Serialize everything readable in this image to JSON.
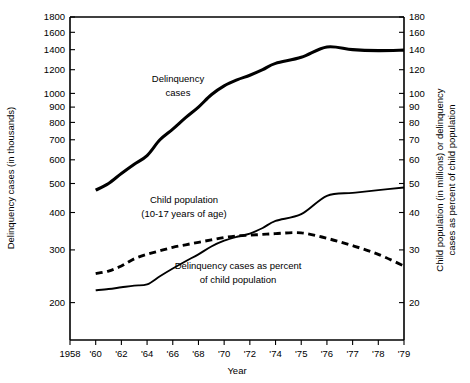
{
  "chart_data": {
    "type": "line",
    "title": "",
    "xlabel": "Year",
    "ylabel": "Delinquency cases (in thousands)",
    "y2label": "Child population (in millions) or delinquency cases as percent of child population",
    "yscale": "log",
    "y2scale": "log",
    "ylim": [
      150,
      1800
    ],
    "y2lim": [
      15,
      180
    ],
    "grid": false,
    "legend_position": "inline-annotations",
    "x_tick_labels": [
      "1958",
      "'60",
      "'62",
      "'64",
      "'66",
      "'68",
      "'70",
      "'72",
      "'74",
      "'75",
      "'76",
      "'77",
      "'78",
      "'79"
    ],
    "x_tick_years": [
      1958,
      1960,
      1962,
      1964,
      1966,
      1968,
      1970,
      1972,
      1974,
      1975,
      1976,
      1977,
      1978,
      1979
    ],
    "y_tick_labels": [
      "1800",
      "1600",
      "1400",
      "1200",
      "1000",
      "900",
      "800",
      "700",
      "600",
      "500",
      "400",
      "300",
      "200"
    ],
    "y_tick_values": [
      1800,
      1600,
      1400,
      1200,
      1000,
      900,
      800,
      700,
      600,
      500,
      400,
      300,
      200
    ],
    "y2_tick_labels": [
      "180",
      "160",
      "140",
      "120",
      "100",
      "90",
      "80",
      "70",
      "60",
      "50",
      "40",
      "30",
      "20"
    ],
    "y2_tick_values": [
      180,
      160,
      140,
      120,
      100,
      90,
      80,
      70,
      60,
      50,
      40,
      30,
      20
    ],
    "series": [
      {
        "name": "Delinquency cases",
        "label": "Delinquency\ncases",
        "label_line1": "Delinquency",
        "label_line2": "cases",
        "style": "solid",
        "axis": "left",
        "units": "thousands",
        "x": [
          1960,
          1961,
          1962,
          1963,
          1964,
          1965,
          1966,
          1967,
          1968,
          1969,
          1970,
          1971,
          1972,
          1973,
          1974,
          1975,
          1976,
          1977,
          1978,
          1979
        ],
        "values": [
          475,
          500,
          540,
          580,
          620,
          700,
          760,
          830,
          900,
          990,
          1060,
          1110,
          1150,
          1200,
          1260,
          1320,
          1430,
          1400,
          1390,
          1395
        ]
      },
      {
        "name": "Child population (10-17 years of age)",
        "label_line1": "Child population",
        "label_line2": "(10-17 years of age)",
        "style": "dashed",
        "axis": "right",
        "units": "millions",
        "x": [
          1960,
          1961,
          1962,
          1963,
          1964,
          1965,
          1966,
          1967,
          1968,
          1969,
          1970,
          1971,
          1972,
          1973,
          1974,
          1975,
          1976,
          1977,
          1978,
          1979
        ],
        "values": [
          25.0,
          25.5,
          26.5,
          28.0,
          29.0,
          29.8,
          30.6,
          31.2,
          31.8,
          32.4,
          33.0,
          33.4,
          33.6,
          33.8,
          34.0,
          34.2,
          32.8,
          31.0,
          29.0,
          26.5
        ]
      },
      {
        "name": "Delinquency cases as percent of child population",
        "label_line1": "Delinquency cases as percent",
        "label_line2": "of child population",
        "style": "solid",
        "axis": "right",
        "units": "percent",
        "x": [
          1960,
          1961,
          1962,
          1963,
          1964,
          1965,
          1966,
          1967,
          1968,
          1969,
          1970,
          1971,
          1972,
          1973,
          1974,
          1975,
          1976,
          1977,
          1978,
          1979
        ],
        "values": [
          22.0,
          22.2,
          22.5,
          22.8,
          23.0,
          24.5,
          26.0,
          27.5,
          29.0,
          30.8,
          32.2,
          33.2,
          34.0,
          35.5,
          37.5,
          39.5,
          45.5,
          46.5,
          47.5,
          48.5
        ]
      }
    ]
  }
}
